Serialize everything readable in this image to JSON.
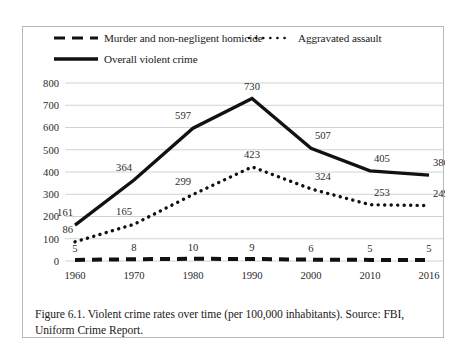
{
  "figure": {
    "caption": "Figure 6.1. Violent crime rates over time (per 100,000 inhabitants). Source: FBI, Uniform Crime Report."
  },
  "legend": {
    "items": [
      {
        "label": "Murder and non-negligent homicide",
        "style": "dashed",
        "swatch": "dashed-line-swatch"
      },
      {
        "label": "Aggravated assault",
        "style": "dotted",
        "swatch": "dotted-line-swatch"
      },
      {
        "label": "Overall violent crime",
        "style": "solid",
        "swatch": "solid-line-swatch"
      }
    ]
  },
  "chart_data": {
    "type": "line",
    "title": "",
    "subtitle": "",
    "xlabel": "",
    "ylabel": "",
    "x": [
      1960,
      1970,
      1980,
      1990,
      2000,
      2010,
      2016
    ],
    "categories": [
      "1960",
      "1970",
      "1980",
      "1990",
      "2000",
      "2010",
      "2016"
    ],
    "xtick_labels": [
      "1960",
      "1970",
      "1980",
      "1990",
      "2000",
      "2010",
      "2016"
    ],
    "ytick_labels": [
      "0",
      "100",
      "200",
      "300",
      "400",
      "500",
      "600",
      "700",
      "800"
    ],
    "yticks": [
      0,
      100,
      200,
      300,
      400,
      500,
      600,
      700,
      800
    ],
    "ylim": [
      0,
      800
    ],
    "grid": "horizontal",
    "legend_position": "top",
    "series": [
      {
        "name": "Overall violent crime",
        "style": "solid",
        "values": [
          161,
          364,
          597,
          730,
          507,
          405,
          386
        ],
        "labels": [
          "161",
          "364",
          "597",
          "730",
          "507",
          "405",
          "386"
        ]
      },
      {
        "name": "Aggravated assault",
        "style": "dotted",
        "values": [
          86,
          165,
          299,
          423,
          324,
          253,
          249
        ],
        "labels": [
          "86",
          "165",
          "299",
          "423",
          "324",
          "253",
          "249"
        ]
      },
      {
        "name": "Murder and non-negligent homicide",
        "style": "dashed",
        "values": [
          5,
          8,
          10,
          9,
          6,
          5,
          5
        ],
        "labels": [
          "5",
          "8",
          "10",
          "9",
          "6",
          "5",
          "5"
        ]
      }
    ]
  }
}
